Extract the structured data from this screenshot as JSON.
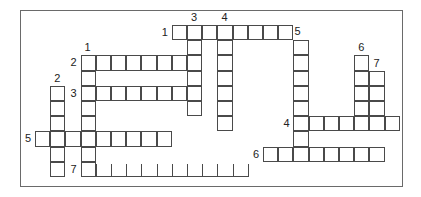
{
  "puzzle": {
    "type": "crossword",
    "grid": {
      "origin_x": 35,
      "origin_y": 25,
      "cell": 15.2
    },
    "entries": [
      {
        "id": "1-across",
        "label": "1",
        "dir": "across",
        "row": 0,
        "col": 9,
        "len": 8,
        "label_pos": "left"
      },
      {
        "id": "2-across",
        "label": "2",
        "dir": "across",
        "row": 2,
        "col": 3,
        "len": 8,
        "label_pos": "left"
      },
      {
        "id": "3-across",
        "label": "3",
        "dir": "across",
        "row": 4,
        "col": 3,
        "len": 8,
        "label_pos": "left"
      },
      {
        "id": "4-across",
        "label": "4",
        "dir": "across",
        "row": 6,
        "col": 17,
        "len": 7,
        "label_pos": "left"
      },
      {
        "id": "5-across",
        "label": "5",
        "dir": "across",
        "row": 7,
        "col": 0,
        "len": 9,
        "label_pos": "left"
      },
      {
        "id": "6-across",
        "label": "6",
        "dir": "across",
        "row": 8,
        "col": 15,
        "len": 8,
        "label_pos": "left"
      },
      {
        "id": "7-across",
        "label": "7",
        "dir": "across",
        "row": 9,
        "col": 3,
        "len": 11,
        "label_pos": "left",
        "open": true
      },
      {
        "id": "1-down",
        "label": "1",
        "dir": "down",
        "row": 2,
        "col": 3,
        "len": 8,
        "label_pos": "top"
      },
      {
        "id": "2-down",
        "label": "2",
        "dir": "down",
        "row": 4,
        "col": 1,
        "len": 6,
        "label_pos": "top"
      },
      {
        "id": "3-down",
        "label": "3",
        "dir": "down",
        "row": 0,
        "col": 10,
        "len": 6,
        "label_pos": "top"
      },
      {
        "id": "4-down",
        "label": "4",
        "dir": "down",
        "row": 0,
        "col": 12,
        "len": 7,
        "label_pos": "top"
      },
      {
        "id": "5-down",
        "label": "5",
        "dir": "down",
        "row": 1,
        "col": 17,
        "len": 8,
        "label_pos": "topright"
      },
      {
        "id": "6-down",
        "label": "6",
        "dir": "down",
        "row": 2,
        "col": 21,
        "len": 5,
        "label_pos": "top"
      },
      {
        "id": "7-down",
        "label": "7",
        "dir": "down",
        "row": 3,
        "col": 22,
        "len": 4,
        "label_pos": "top"
      }
    ]
  }
}
